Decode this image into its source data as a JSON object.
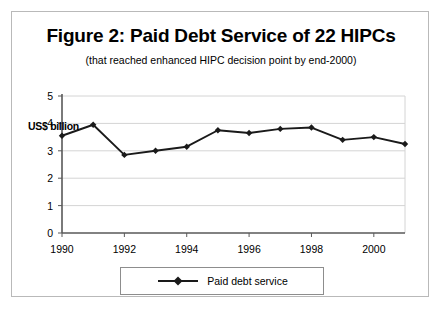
{
  "figure": {
    "title": "Figure 2: Paid Debt Service of 22 HIPCs",
    "subtitle": "(that reached enhanced HIPC decision point by end-2000)",
    "unit_label": "US$ billion"
  },
  "legend": {
    "entry_label": "Paid debt service",
    "symbol_name": "line-marker-diamond"
  },
  "colors": {
    "series_line": "#1a1a1a",
    "grid": "#d4d4d4",
    "axis": "#595959",
    "frame": "#b9b9b9",
    "legend_border": "#8d8d8d",
    "background": "#ffffff"
  },
  "chart_data": {
    "type": "line",
    "title": "Figure 2: Paid Debt Service of 22 HIPCs",
    "subtitle": "(that reached enhanced HIPC decision point by end-2000)",
    "xlabel": "",
    "ylabel": "US$ billion",
    "x": [
      1990,
      1991,
      1992,
      1993,
      1994,
      1995,
      1996,
      1997,
      1998,
      1999,
      2000,
      2001
    ],
    "series": [
      {
        "name": "Paid debt service",
        "values": [
          3.55,
          3.95,
          2.85,
          3.0,
          3.15,
          3.75,
          3.65,
          3.8,
          3.85,
          3.4,
          3.5,
          3.25
        ]
      }
    ],
    "ylim": [
      0,
      5
    ],
    "yticks": [
      0,
      1,
      2,
      3,
      4,
      5
    ],
    "ytick_labels": [
      "0",
      "1",
      "2",
      "3",
      "4",
      "5"
    ],
    "xlim": [
      1990,
      2001
    ],
    "xticks": [
      1990,
      1992,
      1994,
      1996,
      1998,
      2000
    ],
    "xtick_labels": [
      "1990",
      "1992",
      "1994",
      "1996",
      "1998",
      "2000"
    ],
    "grid": "horizontal",
    "legend_position": "bottom"
  }
}
